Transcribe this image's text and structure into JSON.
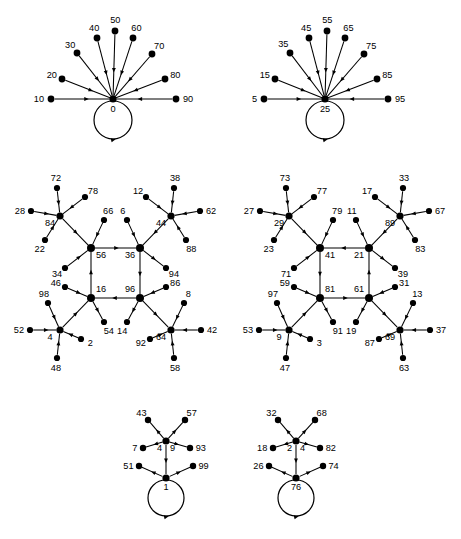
{
  "figure": {
    "panel_count": 6,
    "caption": "",
    "stroke_color": "#000000",
    "background_color": "#ffffff"
  },
  "panels": [
    {
      "id": "top-left",
      "name": "star-graph-0",
      "type": "star-with-self-loop",
      "center": {
        "label": "0",
        "x": 113,
        "y": 99,
        "has_self_loop": true,
        "loop_direction": "clockwise"
      },
      "leaves": [
        {
          "label": "10",
          "x": 51,
          "y": 99,
          "direction": "in"
        },
        {
          "label": "20",
          "x": 62,
          "y": 79,
          "direction": "in"
        },
        {
          "label": "30",
          "x": 77,
          "y": 53,
          "direction": "in"
        },
        {
          "label": "40",
          "x": 97,
          "y": 38,
          "direction": "in"
        },
        {
          "label": "50",
          "x": 115,
          "y": 31,
          "direction": "in"
        },
        {
          "label": "60",
          "x": 133,
          "y": 38,
          "direction": "in"
        },
        {
          "label": "70",
          "x": 152,
          "y": 54,
          "direction": "in"
        },
        {
          "label": "80",
          "x": 165,
          "y": 79,
          "direction": "in"
        },
        {
          "label": "90",
          "x": 176,
          "y": 99,
          "direction": "in"
        }
      ]
    },
    {
      "id": "top-right",
      "name": "star-graph-25",
      "type": "star-with-self-loop",
      "center": {
        "label": "25",
        "x": 325,
        "y": 99,
        "has_self_loop": true,
        "loop_direction": "clockwise"
      },
      "leaves": [
        {
          "label": "5",
          "x": 264,
          "y": 99,
          "direction": "in"
        },
        {
          "label": "15",
          "x": 275,
          "y": 79,
          "direction": "in"
        },
        {
          "label": "35",
          "x": 290,
          "y": 53,
          "direction": "in"
        },
        {
          "label": "45",
          "x": 309,
          "y": 38,
          "direction": "in"
        },
        {
          "label": "55",
          "x": 327,
          "y": 31,
          "direction": "in"
        },
        {
          "label": "65",
          "x": 345,
          "y": 38,
          "direction": "in"
        },
        {
          "label": "75",
          "x": 364,
          "y": 54,
          "direction": "in"
        },
        {
          "label": "85",
          "x": 377,
          "y": 79,
          "direction": "in"
        },
        {
          "label": "95",
          "x": 388,
          "y": 99,
          "direction": "in"
        }
      ]
    },
    {
      "id": "middle-left",
      "name": "cycle-graph-56-36-96-16",
      "type": "cycle-with-branches",
      "cycle": [
        "56",
        "36",
        "96",
        "16"
      ],
      "cycle_edges": [
        {
          "from": "56",
          "to": "36"
        },
        {
          "from": "36",
          "to": "96"
        },
        {
          "from": "96",
          "to": "16"
        },
        {
          "from": "16",
          "to": "56"
        }
      ],
      "hubs": [
        {
          "label": "56",
          "x": 91,
          "y": 248
        },
        {
          "label": "36",
          "x": 140,
          "y": 248
        },
        {
          "label": "96",
          "x": 140,
          "y": 298
        },
        {
          "label": "16",
          "x": 91,
          "y": 298
        }
      ],
      "branch_hubs": [
        {
          "label": "84",
          "x": 60,
          "y": 216,
          "attached_to": "56",
          "edge_direction": "to-cycle",
          "leaves": [
            {
              "label": "72",
              "x": 57,
              "y": 188
            },
            {
              "label": "78",
              "x": 85,
              "y": 197
            },
            {
              "label": "28",
              "x": 31,
              "y": 211
            },
            {
              "label": "22",
              "x": 45,
              "y": 240
            }
          ]
        },
        {
          "label": "44",
          "x": 171,
          "y": 216,
          "attached_to": "36",
          "edge_direction": "to-cycle",
          "leaves": [
            {
              "label": "38",
              "x": 174,
              "y": 188
            },
            {
              "label": "12",
              "x": 146,
              "y": 197
            },
            {
              "label": "62",
              "x": 200,
              "y": 211
            },
            {
              "label": "88",
              "x": 186,
              "y": 240
            }
          ]
        },
        {
          "label": "4",
          "x": 60,
          "y": 330,
          "attached_to": "16",
          "edge_direction": "to-cycle",
          "leaves": [
            {
              "label": "98",
              "x": 48,
              "y": 303
            },
            {
              "label": "52",
              "x": 30,
              "y": 330
            },
            {
              "label": "2",
              "x": 81,
              "y": 339
            },
            {
              "label": "48",
              "x": 57,
              "y": 358
            }
          ]
        },
        {
          "label": "64",
          "x": 171,
          "y": 330,
          "attached_to": "96",
          "edge_direction": "from-cycle",
          "leaves": [
            {
              "label": "8",
              "x": 184,
              "y": 303
            },
            {
              "label": "42",
              "x": 201,
              "y": 330
            },
            {
              "label": "58",
              "x": 174,
              "y": 358
            },
            {
              "label": "92",
              "x": 150,
              "y": 339
            }
          ]
        }
      ],
      "cycle_leaves": [
        {
          "label": "66",
          "x": 104,
          "y": 220,
          "attached_to": "56",
          "direction": "in"
        },
        {
          "label": "34",
          "x": 65,
          "y": 268,
          "attached_to": "56",
          "direction": "in"
        },
        {
          "label": "6",
          "x": 127,
          "y": 220,
          "attached_to": "36",
          "direction": "in"
        },
        {
          "label": "94",
          "x": 166,
          "y": 268,
          "attached_to": "36",
          "direction": "out"
        },
        {
          "label": "86",
          "x": 166,
          "y": 287,
          "attached_to": "96",
          "direction": "in"
        },
        {
          "label": "14",
          "x": 127,
          "y": 322,
          "attached_to": "96",
          "direction": "out"
        },
        {
          "label": "46",
          "x": 65,
          "y": 287,
          "attached_to": "16",
          "direction": "in"
        },
        {
          "label": "54",
          "x": 104,
          "y": 322,
          "attached_to": "16",
          "direction": "out"
        }
      ]
    },
    {
      "id": "middle-right",
      "name": "cycle-graph-41-21-61-81",
      "type": "cycle-with-branches",
      "cycle": [
        "21",
        "41",
        "81",
        "61"
      ],
      "cycle_edges": [
        {
          "from": "21",
          "to": "41"
        },
        {
          "from": "41",
          "to": "81"
        },
        {
          "from": "81",
          "to": "61"
        },
        {
          "from": "61",
          "to": "21"
        }
      ],
      "hubs": [
        {
          "label": "41",
          "x": 320,
          "y": 248
        },
        {
          "label": "21",
          "x": 369,
          "y": 248
        },
        {
          "label": "61",
          "x": 369,
          "y": 298
        },
        {
          "label": "81",
          "x": 320,
          "y": 298
        }
      ],
      "branch_hubs": [
        {
          "label": "29",
          "x": 289,
          "y": 216,
          "attached_to": "41",
          "edge_direction": "to-cycle",
          "leaves": [
            {
              "label": "73",
              "x": 286,
              "y": 188
            },
            {
              "label": "77",
              "x": 314,
              "y": 197
            },
            {
              "label": "27",
              "x": 260,
              "y": 211
            },
            {
              "label": "23",
              "x": 274,
              "y": 240
            }
          ]
        },
        {
          "label": "89",
          "x": 400,
          "y": 216,
          "attached_to": "21",
          "edge_direction": "to-cycle",
          "leaves": [
            {
              "label": "33",
              "x": 403,
              "y": 188
            },
            {
              "label": "17",
              "x": 375,
              "y": 197
            },
            {
              "label": "67",
              "x": 429,
              "y": 211
            },
            {
              "label": "83",
              "x": 415,
              "y": 240
            }
          ]
        },
        {
          "label": "9",
          "x": 289,
          "y": 330,
          "attached_to": "81",
          "edge_direction": "to-cycle",
          "leaves": [
            {
              "label": "97",
              "x": 277,
              "y": 303
            },
            {
              "label": "53",
              "x": 259,
              "y": 330
            },
            {
              "label": "3",
              "x": 310,
              "y": 339
            },
            {
              "label": "47",
              "x": 286,
              "y": 358
            }
          ]
        },
        {
          "label": "69",
          "x": 400,
          "y": 330,
          "attached_to": "61",
          "edge_direction": "from-cycle",
          "leaves": [
            {
              "label": "13",
              "x": 413,
              "y": 303
            },
            {
              "label": "37",
              "x": 430,
              "y": 330
            },
            {
              "label": "63",
              "x": 403,
              "y": 358
            },
            {
              "label": "87",
              "x": 379,
              "y": 339
            }
          ]
        }
      ],
      "cycle_leaves": [
        {
          "label": "79",
          "x": 333,
          "y": 220,
          "attached_to": "41",
          "direction": "in"
        },
        {
          "label": "71",
          "x": 294,
          "y": 268,
          "attached_to": "41",
          "direction": "in"
        },
        {
          "label": "11",
          "x": 356,
          "y": 220,
          "attached_to": "21",
          "direction": "in"
        },
        {
          "label": "39",
          "x": 395,
          "y": 268,
          "attached_to": "21",
          "direction": "out"
        },
        {
          "label": "31",
          "x": 395,
          "y": 287,
          "attached_to": "61",
          "direction": "in"
        },
        {
          "label": "19",
          "x": 356,
          "y": 322,
          "attached_to": "61",
          "direction": "out"
        },
        {
          "label": "59",
          "x": 294,
          "y": 287,
          "attached_to": "81",
          "direction": "in"
        },
        {
          "label": "91",
          "x": 333,
          "y": 322,
          "attached_to": "81",
          "direction": "out"
        }
      ]
    },
    {
      "id": "bottom-left",
      "name": "chain-graph-1",
      "type": "two-level-star-with-self-loop",
      "root": {
        "label": "1",
        "x": 166,
        "y": 478,
        "has_self_loop": true,
        "loop_direction": "clockwise"
      },
      "mid": {
        "label": "4",
        "x": 166,
        "y": 441,
        "second_label": "9"
      },
      "mid_edge": {
        "from": "4",
        "to": "1"
      },
      "mid_leaves": [
        {
          "label": "43",
          "x": 148,
          "y": 420,
          "direction": "out"
        },
        {
          "label": "57",
          "x": 185,
          "y": 420,
          "direction": "out"
        },
        {
          "label": "7",
          "x": 143,
          "y": 448,
          "direction": "out"
        },
        {
          "label": "93",
          "x": 190,
          "y": 448,
          "direction": "out"
        }
      ],
      "root_leaves": [
        {
          "label": "51",
          "x": 139,
          "y": 466,
          "direction": "out"
        },
        {
          "label": "99",
          "x": 193,
          "y": 466,
          "direction": "out"
        }
      ]
    },
    {
      "id": "bottom-right",
      "name": "chain-graph-76",
      "type": "two-level-star-with-self-loop",
      "root": {
        "label": "76",
        "x": 296,
        "y": 478,
        "has_self_loop": true,
        "loop_direction": "clockwise"
      },
      "mid": {
        "label": "2",
        "x": 296,
        "y": 441,
        "second_label": "4"
      },
      "mid_edge": {
        "from": "2",
        "to": "76"
      },
      "mid_leaves": [
        {
          "label": "32",
          "x": 278,
          "y": 420,
          "direction": "out"
        },
        {
          "label": "68",
          "x": 315,
          "y": 420,
          "direction": "out"
        },
        {
          "label": "18",
          "x": 273,
          "y": 448,
          "direction": "out"
        },
        {
          "label": "82",
          "x": 320,
          "y": 448,
          "direction": "out"
        }
      ],
      "root_leaves": [
        {
          "label": "26",
          "x": 269,
          "y": 466,
          "direction": "out"
        },
        {
          "label": "74",
          "x": 323,
          "y": 466,
          "direction": "out"
        }
      ]
    }
  ]
}
